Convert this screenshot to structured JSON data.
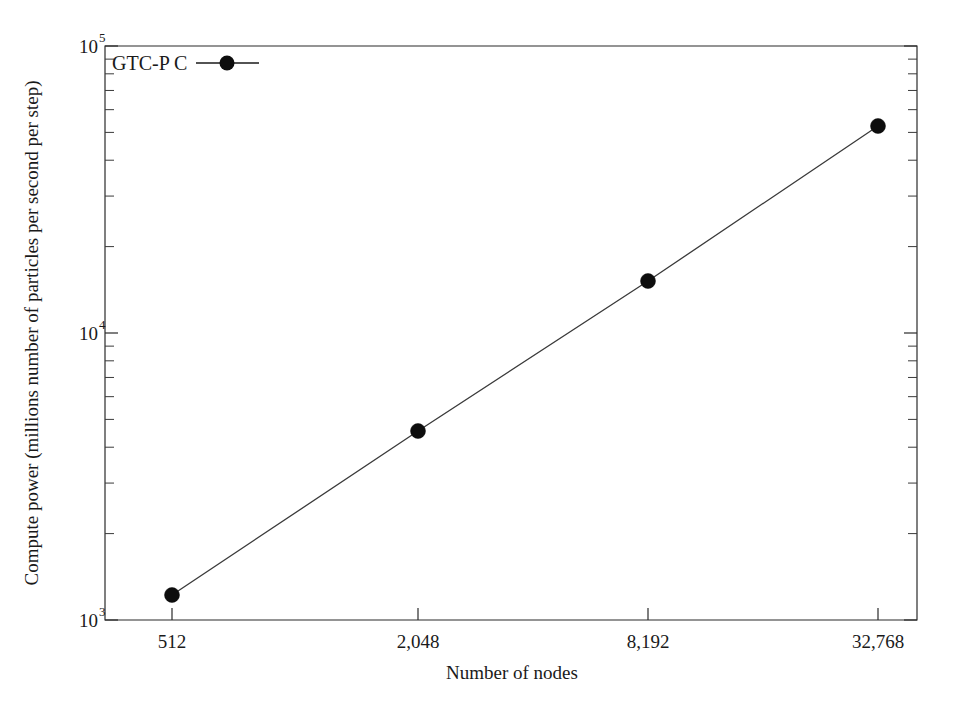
{
  "chart_data": {
    "type": "line",
    "title": "",
    "xlabel": "Number of nodes",
    "ylabel": "Compute power (millions number of particles per second per step)",
    "xscale": "log",
    "yscale": "log",
    "xlim": [
      362,
      46341
    ],
    "ylim": [
      1000,
      100000
    ],
    "grid": false,
    "x_tick_labels": [
      "512",
      "2,048",
      "8,192",
      "32,768"
    ],
    "x_tick_values": [
      512,
      2048,
      8192,
      32768
    ],
    "y_tick_labels": [
      "10^3",
      "10^4",
      "10^5"
    ],
    "y_tick_mantissa": [
      "10",
      "10",
      "10"
    ],
    "y_tick_exponents": [
      "3",
      "4",
      "5"
    ],
    "y_tick_values": [
      1000,
      10000,
      100000
    ],
    "legend_position": "top-left",
    "series": [
      {
        "name": "GTC-P C",
        "marker": "filled-circle",
        "color": "#0d0d0d",
        "x": [
          512,
          2048,
          8192,
          32768
        ],
        "values": [
          1220,
          4250,
          15200,
          52000
        ]
      }
    ]
  },
  "legend": {
    "entries": [
      {
        "label": "GTC-P C"
      }
    ]
  },
  "axes": {
    "x_title": "Number of nodes",
    "y_title": "Compute power (millions number of particles per second per step)"
  }
}
